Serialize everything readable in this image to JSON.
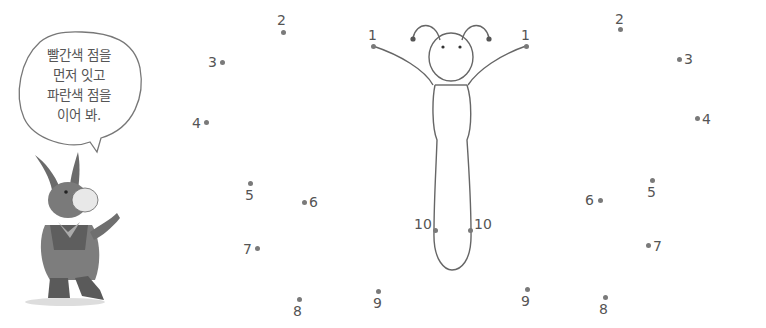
{
  "instruction_bubble": {
    "lines": [
      "빨간색 점을",
      "먼저 잇고",
      "파란색 점을",
      "이어 봐."
    ]
  },
  "character": {
    "name": "donkey-character"
  },
  "drawing": {
    "name": "butterfly-body-outline"
  },
  "dots_left": [
    {
      "label": "1",
      "x": 373,
      "y": 46,
      "lx": 368,
      "ly": 28
    },
    {
      "label": "2",
      "x": 283,
      "y": 32,
      "lx": 277,
      "ly": 13
    },
    {
      "label": "3",
      "x": 222,
      "y": 62,
      "lx": 208,
      "ly": 55
    },
    {
      "label": "4",
      "x": 206,
      "y": 122,
      "lx": 192,
      "ly": 116
    },
    {
      "label": "5",
      "x": 250,
      "y": 183,
      "lx": 245,
      "ly": 188
    },
    {
      "label": "6",
      "x": 304,
      "y": 202,
      "lx": 309,
      "ly": 195
    },
    {
      "label": "7",
      "x": 257,
      "y": 248,
      "lx": 243,
      "ly": 242
    },
    {
      "label": "8",
      "x": 299,
      "y": 299,
      "lx": 293,
      "ly": 304
    },
    {
      "label": "9",
      "x": 378,
      "y": 291,
      "lx": 373,
      "ly": 296
    },
    {
      "label": "10",
      "x": 435,
      "y": 230,
      "lx": 414,
      "ly": 217
    }
  ],
  "dots_right": [
    {
      "label": "1",
      "x": 526,
      "y": 46,
      "lx": 521,
      "ly": 28
    },
    {
      "label": "2",
      "x": 620,
      "y": 29,
      "lx": 615,
      "ly": 12
    },
    {
      "label": "3",
      "x": 679,
      "y": 59,
      "lx": 684,
      "ly": 52
    },
    {
      "label": "4",
      "x": 697,
      "y": 118,
      "lx": 702,
      "ly": 112
    },
    {
      "label": "5",
      "x": 652,
      "y": 180,
      "lx": 647,
      "ly": 185
    },
    {
      "label": "6",
      "x": 600,
      "y": 200,
      "lx": 585,
      "ly": 193
    },
    {
      "label": "7",
      "x": 648,
      "y": 245,
      "lx": 653,
      "ly": 239
    },
    {
      "label": "8",
      "x": 605,
      "y": 297,
      "lx": 599,
      "ly": 302
    },
    {
      "label": "9",
      "x": 527,
      "y": 289,
      "lx": 521,
      "ly": 294
    },
    {
      "label": "10",
      "x": 470,
      "y": 230,
      "lx": 474,
      "ly": 217
    }
  ]
}
